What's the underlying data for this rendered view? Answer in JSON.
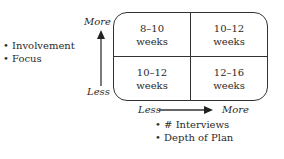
{
  "y_axis": {
    "high_label": "More",
    "low_label": "Less",
    "factors": [
      "Involvement",
      "Focus"
    ]
  },
  "x_axis": {
    "low_label": "Less",
    "high_label": "More",
    "factors": [
      "# Interviews",
      "Depth of Plan"
    ]
  },
  "cells": {
    "top_left": {
      "range": "8–10",
      "unit": "weeks"
    },
    "top_right": {
      "range": "10–12",
      "unit": "weeks"
    },
    "bottom_left": {
      "range": "10–12",
      "unit": "weeks"
    },
    "bottom_right": {
      "range": "12–16",
      "unit": "weeks"
    }
  },
  "colors": {
    "line": "#333333",
    "text": "#2a2a2a"
  }
}
